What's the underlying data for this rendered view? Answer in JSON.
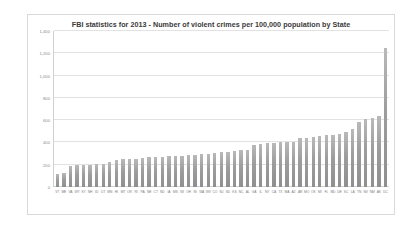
{
  "chart_data": {
    "type": "bar",
    "title": "FBI statistics for 2013 - Number of violent crimes per 100,000 population by State",
    "xlabel": "",
    "ylabel": "",
    "ylim": [
      0,
      1400
    ],
    "y_ticks": [
      0,
      200,
      400,
      600,
      800,
      1000,
      1200,
      1400
    ],
    "y_tick_labels": [
      "0",
      "200",
      "400",
      "600",
      "800",
      "1,000",
      "1,200",
      "1,400"
    ],
    "grid": true,
    "legend": false,
    "bar_color": "#a6a6a6",
    "categories": [
      "VT",
      "ME",
      "VA",
      "WY",
      "KY",
      "NH",
      "ID",
      "UT",
      "MN",
      "HI",
      "MT",
      "OR",
      "RI",
      "PA",
      "NE",
      "CT",
      "ND",
      "IA",
      "MS",
      "WI",
      "OH",
      "IN",
      "WA",
      "WV",
      "CO",
      "NJ",
      "SD",
      "KS",
      "NC",
      "AL",
      "GA",
      "IL",
      "NY",
      "CA",
      "TX",
      "MA",
      "AZ",
      "AR",
      "MO",
      "OK",
      "MI",
      "FL",
      "MD",
      "DE",
      "SC",
      "LA",
      "TN",
      "NV",
      "NM",
      "AK",
      "DC"
    ],
    "values": [
      121,
      128,
      191,
      196,
      200,
      200,
      207,
      209,
      223,
      239,
      251,
      252,
      253,
      263,
      268,
      271,
      273,
      274,
      275,
      280,
      285,
      289,
      293,
      297,
      309,
      310,
      314,
      320,
      331,
      335,
      378,
      384,
      394,
      396,
      403,
      405,
      408,
      438,
      442,
      450,
      454,
      469,
      471,
      478,
      490,
      518,
      580,
      608,
      615,
      640,
      1248
    ],
    "annotations": []
  }
}
